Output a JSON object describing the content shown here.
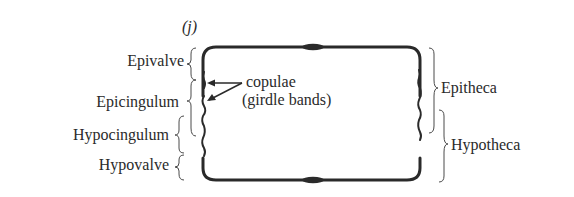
{
  "figure": {
    "panel_label": "(j)",
    "left_labels": {
      "epivalve": "Epivalve",
      "epicingulum": "Epicingulum",
      "hypocingulum": "Hypocingulum",
      "hypovalve": "Hypovalve"
    },
    "center_annotation": {
      "line1": "copulae",
      "line2": "(girdle bands)"
    },
    "right_labels": {
      "epitheca": "Epitheca",
      "hypotheca": "Hypotheca"
    },
    "colors": {
      "ink": "#2a2a2a",
      "background": "#ffffff"
    }
  }
}
